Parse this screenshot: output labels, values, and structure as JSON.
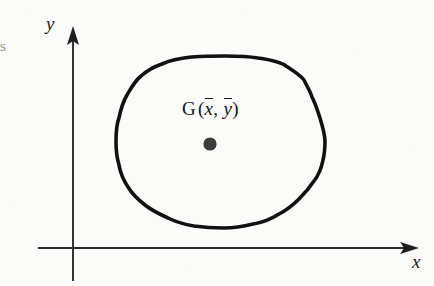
{
  "figure": {
    "type": "geometry-diagram",
    "background_color": "#fbfbfa",
    "ink_color": "#161616",
    "width": 434,
    "height": 286
  },
  "axes": {
    "x_label": "x",
    "y_label": "y",
    "origin": {
      "x": 73,
      "y": 248
    },
    "x_axis": {
      "start_x": 38,
      "end_x": 419,
      "y": 248,
      "arrow": "right"
    },
    "y_axis": {
      "x": 73,
      "start_y": 281,
      "end_y": 26,
      "arrow": "up"
    },
    "line_color": "#2b2b2b"
  },
  "shape": {
    "name": "irregular-closed-lamina",
    "outline_color": "#111111",
    "outline_width": 3.6,
    "bounds": {
      "left": 116,
      "top": 56,
      "right": 325,
      "bottom": 228
    },
    "points": [
      [
        225,
        56
      ],
      [
        258,
        58
      ],
      [
        286,
        66
      ],
      [
        305,
        82
      ],
      [
        312,
        97
      ],
      [
        320,
        118
      ],
      [
        325,
        140
      ],
      [
        323,
        160
      ],
      [
        314,
        181
      ],
      [
        299,
        199
      ],
      [
        279,
        214
      ],
      [
        253,
        224
      ],
      [
        224,
        228
      ],
      [
        194,
        226
      ],
      [
        168,
        218
      ],
      [
        145,
        205
      ],
      [
        128,
        187
      ],
      [
        119,
        165
      ],
      [
        116,
        142
      ],
      [
        119,
        118
      ],
      [
        127,
        95
      ],
      [
        141,
        76
      ],
      [
        162,
        64
      ],
      [
        192,
        57
      ]
    ]
  },
  "centroid": {
    "marker_label_G": "G",
    "marker_label_full": "G (x̄, ȳ)",
    "open_paren": "(",
    "close_paren": ")",
    "comma": ",",
    "x_bar": "x",
    "y_bar": "y",
    "dot": {
      "cx": 210,
      "cy": 144,
      "r": 6.5,
      "color": "#3b3b3b"
    },
    "label_position": {
      "x": 182,
      "y": 99
    }
  },
  "artifacts": {
    "left_edge_fragment": "s"
  }
}
